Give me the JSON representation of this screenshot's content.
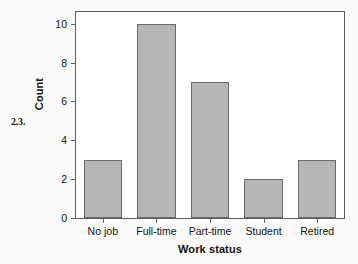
{
  "figure": {
    "exercise_number": "2.3.",
    "background_color": "#fbfbfa",
    "plot_background_color": "#ffffff",
    "frame_color": "#5d5d5d"
  },
  "chart_data": {
    "type": "bar",
    "title": "",
    "subtitle": "",
    "categories": [
      "No job",
      "Full-time",
      "Part-time",
      "Student",
      "Retired"
    ],
    "values": [
      3,
      10,
      7,
      2,
      3
    ],
    "series": [
      {
        "name": "Count",
        "values": [
          3,
          10,
          7,
          2,
          3
        ]
      }
    ],
    "xlabel": "Work status",
    "ylabel": "Count",
    "ylim": [
      0,
      10.6
    ],
    "yticks": [
      0,
      2,
      4,
      6,
      8,
      10
    ],
    "ytick_labels": [
      "0",
      "2",
      "4",
      "6",
      "8",
      "10"
    ],
    "xtick_labels": [
      "No job",
      "Full-time",
      "Part-time",
      "Student",
      "Retired"
    ],
    "grid": false,
    "legend": false,
    "legend_position": "none",
    "bar_fill_color": "#b6b6b6",
    "bar_edge_color": "#6b6b6b",
    "annotations": []
  }
}
